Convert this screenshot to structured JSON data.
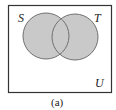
{
  "diagram": {
    "type": "venn",
    "universe_label": "U",
    "sets": [
      {
        "label": "S",
        "cx": 46,
        "cy": 36,
        "r": 23
      },
      {
        "label": "T",
        "cx": 75,
        "cy": 37,
        "r": 23
      }
    ],
    "shaded_region": "S ∪ T",
    "caption": "(a)",
    "colors": {
      "fill": "#c9c9c9",
      "circle_stroke": "#707070",
      "frame_stroke": "#333333",
      "text": "#222222"
    }
  }
}
